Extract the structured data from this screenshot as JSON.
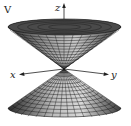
{
  "figure": {
    "panel_label": "V",
    "axes": {
      "x_label": "x",
      "y_label": "y",
      "z_label": "z"
    },
    "surface": "double cone",
    "colors": {
      "mesh_line": "#1a1a1a",
      "surface_light": "#d0d0d0",
      "surface_dark": "#3a3a3a",
      "axis": "#222222"
    }
  }
}
